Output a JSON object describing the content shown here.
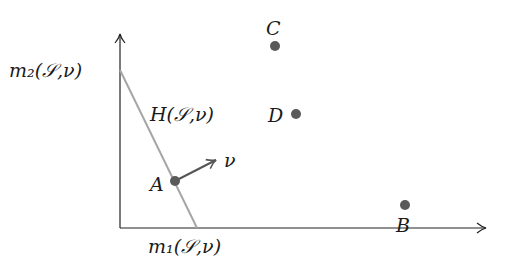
{
  "diagram": {
    "axes": {
      "x_label": "m₁(𝒮,ν)",
      "y_label": "m₂(𝒮,ν)",
      "origin": [
        120,
        228
      ],
      "x_end": [
        487,
        228
      ],
      "y_end": [
        120,
        33
      ]
    },
    "hyperplane": {
      "label": "H(𝒮,ν)",
      "start": [
        120,
        70
      ],
      "end": [
        197,
        228
      ],
      "color": "#a6a6a6"
    },
    "normal_vector": {
      "label": "ν",
      "start": [
        175,
        181
      ],
      "end": [
        217,
        160
      ],
      "color": "#555555"
    },
    "points": [
      {
        "label": "A",
        "x": 175,
        "y": 181
      },
      {
        "label": "B",
        "x": 405,
        "y": 205
      },
      {
        "label": "C",
        "x": 275,
        "y": 46
      },
      {
        "label": "D",
        "x": 296,
        "y": 114
      }
    ],
    "colors": {
      "axis": "#222222",
      "point": "#5a5a5a"
    }
  }
}
